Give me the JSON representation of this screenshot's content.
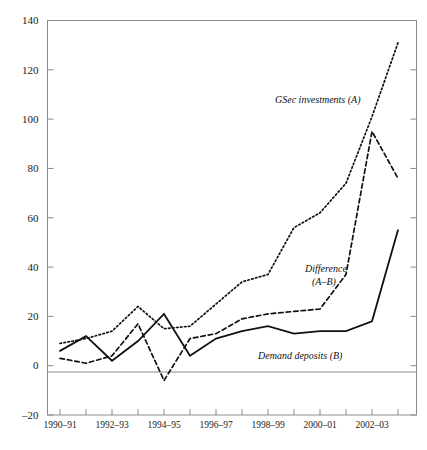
{
  "chart_data": {
    "type": "line",
    "title": "",
    "subtitle": "",
    "xlabel": "",
    "ylabel": "",
    "grid": false,
    "legend_position": "inline-annotations",
    "x": [
      "1990-91",
      "1991-92",
      "1992-93",
      "1993-94",
      "1994-95",
      "1995-96",
      "1996-97",
      "1997-98",
      "1998-99",
      "1999-2000",
      "2000-01",
      "2001-02",
      "2002-03",
      "2003-04"
    ],
    "x_tick_labels": [
      "1990–91",
      "",
      "1992–93",
      "",
      "1994–95",
      "",
      "1996–97",
      "",
      "1998–99",
      "",
      "2000–01",
      "",
      "2002–03",
      ""
    ],
    "x_tick_labels_visible": [
      "1990–91",
      "1992–93",
      "1994–95",
      "1996–97",
      "1998–99",
      "2000–01",
      "2002–03"
    ],
    "ylim": [
      -20,
      140
    ],
    "y_ticks": [
      -20,
      0,
      20,
      40,
      60,
      80,
      100,
      120,
      140
    ],
    "y_tick_labels": [
      "–20",
      "0",
      "20",
      "40",
      "60",
      "80",
      "100",
      "120",
      "140"
    ],
    "series": [
      {
        "name": "GSec investments (A)",
        "style": "dotted",
        "color": "#111111",
        "values": [
          9,
          11,
          14,
          24,
          15,
          16,
          25,
          34,
          37,
          56,
          62,
          74,
          101,
          131
        ]
      },
      {
        "name": "Difference (A–B)",
        "style": "dashed",
        "color": "#111111",
        "values": [
          3,
          1,
          4,
          17,
          -6,
          11,
          13,
          19,
          21,
          22,
          23,
          37,
          95,
          76
        ]
      },
      {
        "name": "Demand deposits (B)",
        "style": "solid",
        "color": "#111111",
        "values": [
          6,
          12,
          2,
          10,
          21,
          4,
          11,
          14,
          16,
          13,
          14,
          14,
          18,
          55
        ]
      }
    ],
    "annotations": [
      {
        "id": "annot-gsec",
        "text": "GSec investments (A)",
        "x": 2000.0,
        "y": 100
      },
      {
        "id": "annot-difference-line1",
        "text": "Difference",
        "x": 2001.0,
        "y": 46
      },
      {
        "id": "annot-difference-line2",
        "text": "(A–B)",
        "x": 2001.0,
        "y": 40
      },
      {
        "id": "annot-demand",
        "text": "Demand deposits (B)",
        "x": 1999.5,
        "y": 8
      }
    ],
    "axis_frame": {
      "top": true,
      "right": true,
      "bottom": true,
      "left": true
    },
    "zero_line": true
  }
}
